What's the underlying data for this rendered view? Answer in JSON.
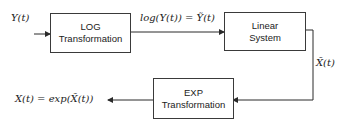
{
  "diagram": {
    "type": "block-diagram",
    "blocks": [
      {
        "id": "log",
        "line1": "LOG",
        "line2": "Transformation"
      },
      {
        "id": "linear",
        "line1": "Linear",
        "line2": "System"
      },
      {
        "id": "exp",
        "line1": "EXP",
        "line2": "Transformation"
      }
    ],
    "labels": {
      "input": "Y(t)",
      "log_output": "log(Y(t)) = Ỹ(t)",
      "linear_output": "X̃(t)",
      "final_output": "X(t) = exp(X̃(t))"
    },
    "edges": [
      {
        "from": "input",
        "to": "log"
      },
      {
        "from": "log",
        "to": "linear",
        "label": "log(Y(t)) = Ỹ(t)"
      },
      {
        "from": "linear",
        "to": "exp",
        "label": "X̃(t)"
      },
      {
        "from": "exp",
        "to": "output",
        "label": "X(t) = exp(X̃(t))"
      }
    ],
    "colors": {
      "line": "#2a2a2a",
      "border": "#3a3a3a",
      "text": "#222222"
    }
  }
}
